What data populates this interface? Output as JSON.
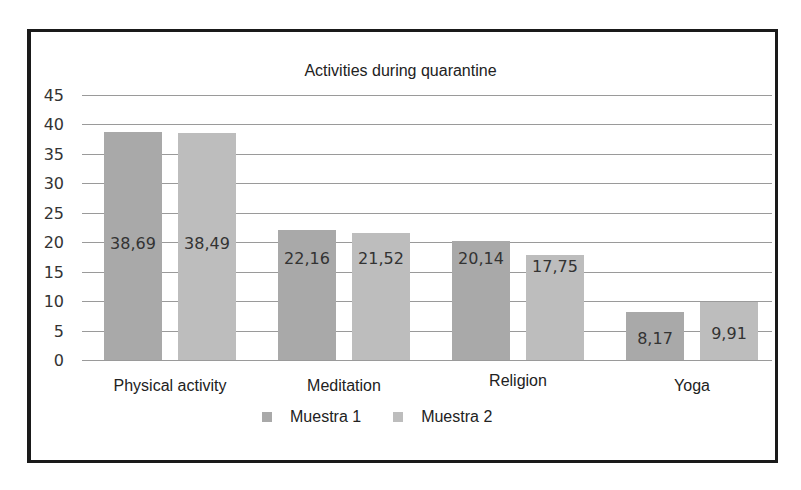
{
  "chart_data": {
    "type": "bar",
    "title": "Activities during quarantine",
    "xlabel": "",
    "ylabel": "",
    "ylim": [
      0,
      45
    ],
    "yticks": [
      0,
      5,
      10,
      15,
      20,
      25,
      30,
      35,
      40,
      45
    ],
    "categories": [
      "Physical activity",
      "Meditation",
      "Religion",
      "Yoga"
    ],
    "series": [
      {
        "name": "Muestra 1",
        "values": [
          38.69,
          22.16,
          20.14,
          8.17
        ],
        "labels": [
          "38,69",
          "22,16",
          "20,14",
          "8,17"
        ],
        "color": "#a9a9a9"
      },
      {
        "name": "Muestra 2",
        "values": [
          38.49,
          21.52,
          17.75,
          9.91
        ],
        "labels": [
          "38,49",
          "21,52",
          "17,75",
          "9,91"
        ],
        "color": "#bdbdbd"
      }
    ],
    "grid": true,
    "legend_position": "bottom"
  }
}
